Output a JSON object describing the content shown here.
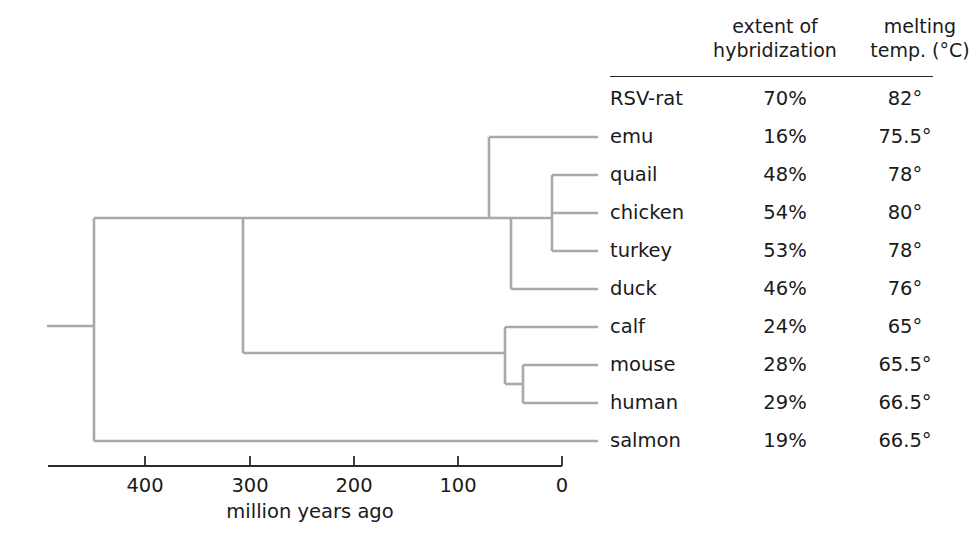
{
  "figure": {
    "line_color": "#a9a9a9",
    "axis_color": "#2b2b2b",
    "text_color": "#1a1a1a"
  },
  "table": {
    "headers": {
      "taxon": "",
      "hybridization_line1": "extent of",
      "hybridization_line2": "hybridization",
      "melting_line1": "melting",
      "melting_line2": "temp. (°C)"
    },
    "rows": [
      {
        "name": "RSV-rat",
        "hybridization": "70%",
        "melting": "82°",
        "y": 99,
        "has_branch": false
      },
      {
        "name": "emu",
        "hybridization": "16%",
        "melting": "75.5°",
        "y": 137,
        "has_branch": true
      },
      {
        "name": "quail",
        "hybridization": "48%",
        "melting": "78°",
        "y": 175,
        "has_branch": true
      },
      {
        "name": "chicken",
        "hybridization": "54%",
        "melting": "80°",
        "y": 213,
        "has_branch": true
      },
      {
        "name": "turkey",
        "hybridization": "53%",
        "melting": "78°",
        "y": 251,
        "has_branch": true
      },
      {
        "name": "duck",
        "hybridization": "46%",
        "melting": "76°",
        "y": 289,
        "has_branch": true
      },
      {
        "name": "calf",
        "hybridization": "24%",
        "melting": "65°",
        "y": 327,
        "has_branch": true
      },
      {
        "name": "mouse",
        "hybridization": "28%",
        "melting": "65.5°",
        "y": 365,
        "has_branch": true
      },
      {
        "name": "human",
        "hybridization": "29%",
        "melting": "66.5°",
        "y": 403,
        "has_branch": true
      },
      {
        "name": "salmon",
        "hybridization": "19%",
        "melting": "66.5°",
        "y": 441,
        "has_branch": true
      }
    ]
  },
  "axis": {
    "caption": "million years ago",
    "ticks": [
      {
        "label": "400",
        "value": 400,
        "x": 145
      },
      {
        "label": "300",
        "value": 300,
        "x": 250
      },
      {
        "label": "200",
        "value": 200,
        "x": 354
      },
      {
        "label": "100",
        "value": 100,
        "x": 458
      },
      {
        "label": "0",
        "value": 0,
        "x": 562
      }
    ],
    "x_start": 48,
    "x_end": 562,
    "y": 466
  },
  "chart_data": {
    "type": "table",
    "xlabel": "million years ago",
    "columns": [
      "taxon",
      "extent of hybridization",
      "melting temp. (°C)"
    ],
    "categories": [
      "RSV-rat",
      "emu",
      "quail",
      "chicken",
      "turkey",
      "duck",
      "calf",
      "mouse",
      "human",
      "salmon"
    ],
    "series": [
      {
        "name": "extent of hybridization (%)",
        "values": [
          70,
          16,
          48,
          54,
          53,
          46,
          24,
          28,
          29,
          19
        ]
      },
      {
        "name": "melting temp. (°C)",
        "values": [
          82,
          75.5,
          78,
          80,
          78,
          76,
          65,
          65.5,
          66.5,
          66.5
        ]
      }
    ],
    "xlim": [
      460,
      0
    ],
    "grid": false,
    "legend": "none",
    "tree": {
      "root_age_mya": 445,
      "nodes": [
        {
          "name": "root-vertebrate",
          "age_mya": 445,
          "children": [
            "amniote-node",
            "salmon"
          ]
        },
        {
          "name": "amniote-node",
          "age_mya": 320,
          "children": [
            "bird-node",
            "mammal-node"
          ]
        },
        {
          "name": "bird-node",
          "age_mya": 100,
          "children": [
            "emu",
            "galliform-duck-node"
          ]
        },
        {
          "name": "galliform-duck-node",
          "age_mya": 80,
          "children": [
            "galliform-node",
            "duck"
          ]
        },
        {
          "name": "galliform-node",
          "age_mya": 40,
          "children": [
            "quail",
            "chicken-turkey-node"
          ]
        },
        {
          "name": "chicken-turkey-node",
          "age_mya": 35,
          "children": [
            "chicken",
            "turkey"
          ]
        },
        {
          "name": "mammal-node",
          "age_mya": 55,
          "children": [
            "calf",
            "mouse-human-node"
          ]
        },
        {
          "name": "mouse-human-node",
          "age_mya": 38,
          "children": [
            "mouse",
            "human"
          ]
        }
      ]
    }
  },
  "tree_geometry": {
    "leaf_tip_x": 598,
    "root_stub_x": 47,
    "root_x": 94,
    "root_y": 326,
    "amniote_x": 243,
    "bird_y": 218,
    "mammal_y": 353,
    "bird_node_x": 489,
    "galliform_duck_x": 511,
    "galliform_x": 552,
    "mammal_node_x": 505,
    "mouse_human_x": 523,
    "salmon_y": 441
  }
}
